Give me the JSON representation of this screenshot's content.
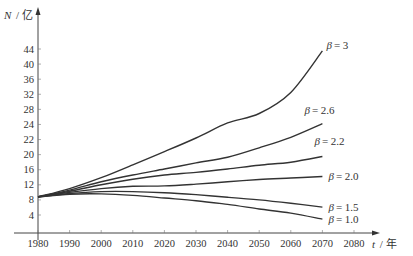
{
  "chart_data": {
    "type": "line",
    "title": "",
    "xlabel": "t / 年",
    "xlabel_var": "t",
    "xlabel_unit": "/ 年",
    "ylabel": "N / 亿",
    "ylabel_var": "N",
    "ylabel_unit": "/ 亿",
    "x_ticks": [
      1980,
      1990,
      2000,
      2010,
      2020,
      2030,
      2040,
      2050,
      2060,
      2070,
      2080
    ],
    "y_ticks": [
      4,
      8,
      12,
      16,
      20,
      22,
      24,
      28,
      32,
      36,
      40,
      44
    ],
    "xlim": [
      1980,
      2085
    ],
    "grid": false,
    "legend": "inline labels at curve ends (right)",
    "x": [
      1980,
      1990,
      2000,
      2010,
      2020,
      2030,
      2040,
      2050,
      2060,
      2070
    ],
    "series": [
      {
        "name": "β = 3",
        "label_prefix": "β",
        "label_value": "= 3",
        "values": [
          8.8,
          11.0,
          13.9,
          17.3,
          20.4,
          22.2,
          24.4,
          26.9,
          32.5,
          43.5
        ]
      },
      {
        "name": "β = 2.6",
        "label_prefix": "β",
        "label_value": "= 2.6",
        "values": [
          8.8,
          10.6,
          12.8,
          14.6,
          16.2,
          17.8,
          19.3,
          20.9,
          22.3,
          24.2
        ]
      },
      {
        "name": "β = 2.2",
        "label_prefix": "β",
        "label_value": "= 2.2",
        "values": [
          8.8,
          10.3,
          12.0,
          13.5,
          14.6,
          15.3,
          16.2,
          17.2,
          18.0,
          19.5
        ]
      },
      {
        "name": "β = 2.0",
        "label_prefix": "β",
        "label_value": "= 2.0",
        "values": [
          8.8,
          10.0,
          11.0,
          11.6,
          11.7,
          12.2,
          12.8,
          13.4,
          13.8,
          14.2
        ]
      },
      {
        "name": "β = 1.5",
        "label_prefix": "β",
        "label_value": "= 1.5",
        "values": [
          8.8,
          9.7,
          10.2,
          10.2,
          9.9,
          9.4,
          8.7,
          8.0,
          7.1,
          6.1
        ]
      },
      {
        "name": "β = 1.0",
        "label_prefix": "β",
        "label_value": "= 1.0",
        "values": [
          8.8,
          9.5,
          9.6,
          9.2,
          8.5,
          7.8,
          6.8,
          5.6,
          4.5,
          3.1
        ]
      }
    ]
  }
}
